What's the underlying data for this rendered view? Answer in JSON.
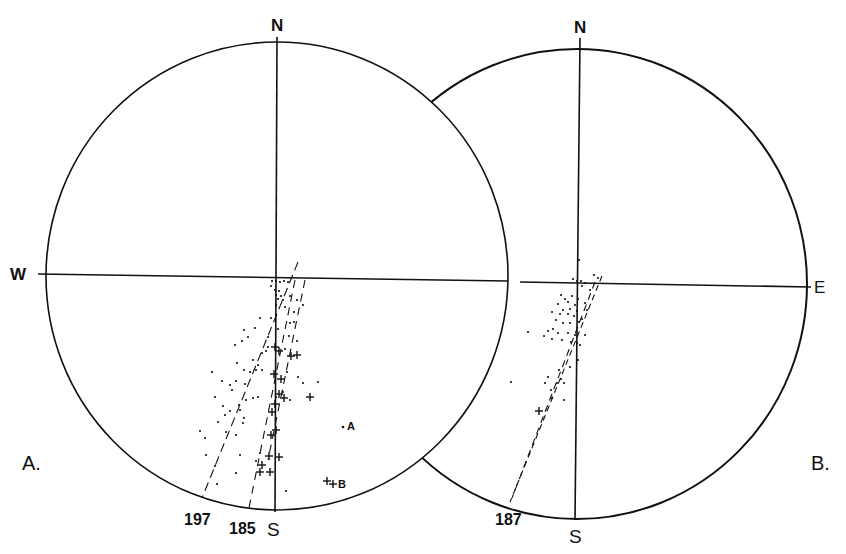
{
  "figure": {
    "panels": [
      {
        "id": "A",
        "panel_label": "A.",
        "directions": {
          "north": "N",
          "south": "S",
          "west": "W"
        },
        "trace_labels": [
          "197",
          "185"
        ],
        "point_labels": {
          "a": "A",
          "b": "B"
        },
        "center": [
          277,
          276
        ],
        "radius": [
          231,
          234
        ]
      },
      {
        "id": "B",
        "panel_label": "B.",
        "directions": {
          "north": "N",
          "south": "S",
          "east": "E"
        },
        "trace_labels": [
          "187"
        ],
        "center": [
          577,
          284
        ],
        "radius": [
          230,
          235
        ]
      }
    ],
    "colors": {
      "ink": "#111111",
      "background": "#ffffff"
    },
    "panelA_dots": [
      [
        272,
        281
      ],
      [
        276,
        281
      ],
      [
        280,
        282
      ],
      [
        284,
        281
      ],
      [
        288,
        282
      ],
      [
        271,
        286
      ],
      [
        275,
        290
      ],
      [
        279,
        291
      ],
      [
        276,
        295
      ],
      [
        281,
        296
      ],
      [
        278,
        299
      ],
      [
        290,
        296
      ],
      [
        283,
        300
      ],
      [
        297,
        300
      ],
      [
        276,
        305
      ],
      [
        285,
        307
      ],
      [
        294,
        312
      ],
      [
        303,
        305
      ],
      [
        276,
        315
      ],
      [
        290,
        323
      ],
      [
        294,
        322
      ],
      [
        271,
        318
      ],
      [
        260,
        318
      ],
      [
        278,
        329
      ],
      [
        268,
        337
      ],
      [
        289,
        336
      ],
      [
        297,
        341
      ],
      [
        255,
        328
      ],
      [
        244,
        330
      ],
      [
        248,
        337
      ],
      [
        285,
        349
      ],
      [
        268,
        347
      ],
      [
        262,
        353
      ],
      [
        253,
        360
      ],
      [
        258,
        365
      ],
      [
        266,
        351
      ],
      [
        242,
        341
      ],
      [
        235,
        345
      ],
      [
        237,
        363
      ],
      [
        244,
        370
      ],
      [
        250,
        372
      ],
      [
        256,
        370
      ],
      [
        262,
        370
      ],
      [
        236,
        381
      ],
      [
        245,
        384
      ],
      [
        212,
        372
      ],
      [
        222,
        381
      ],
      [
        230,
        385
      ],
      [
        232,
        390
      ],
      [
        287,
        372
      ],
      [
        298,
        377
      ],
      [
        303,
        383
      ],
      [
        318,
        382
      ],
      [
        276,
        397
      ],
      [
        283,
        392
      ],
      [
        290,
        400
      ],
      [
        246,
        400
      ],
      [
        239,
        405
      ],
      [
        253,
        398
      ],
      [
        258,
        397
      ],
      [
        215,
        397
      ],
      [
        223,
        406
      ],
      [
        230,
        411
      ],
      [
        240,
        410
      ],
      [
        200,
        431
      ],
      [
        205,
        438
      ],
      [
        218,
        422
      ],
      [
        243,
        423
      ],
      [
        226,
        432
      ],
      [
        236,
        435
      ],
      [
        240,
        455
      ],
      [
        260,
        453
      ],
      [
        256,
        461
      ],
      [
        206,
        455
      ],
      [
        215,
        466
      ],
      [
        236,
        473
      ],
      [
        217,
        484
      ],
      [
        286,
        491
      ],
      [
        225,
        415
      ],
      [
        244,
        418
      ]
    ],
    "panelA_crosses": [
      [
        275,
        347
      ],
      [
        279,
        351
      ],
      [
        291,
        356
      ],
      [
        297,
        355
      ],
      [
        274,
        374
      ],
      [
        281,
        379
      ],
      [
        279,
        394
      ],
      [
        284,
        398
      ],
      [
        310,
        397
      ],
      [
        275,
        404
      ],
      [
        272,
        412
      ],
      [
        276,
        430
      ],
      [
        271,
        435
      ],
      [
        269,
        456
      ],
      [
        279,
        457
      ],
      [
        262,
        465
      ],
      [
        260,
        472
      ],
      [
        270,
        472
      ],
      [
        327,
        481
      ]
    ],
    "panelA_point_A": [
      343,
      427
    ],
    "panelA_point_B": [
      333,
      484
    ],
    "panelB_dots": [
      [
        579,
        260
      ],
      [
        573,
        279
      ],
      [
        577,
        281
      ],
      [
        581,
        281
      ],
      [
        585,
        283
      ],
      [
        594,
        275
      ],
      [
        598,
        278
      ],
      [
        582,
        286
      ],
      [
        590,
        290
      ],
      [
        561,
        295
      ],
      [
        565,
        299
      ],
      [
        572,
        296
      ],
      [
        578,
        299
      ],
      [
        568,
        302
      ],
      [
        575,
        305
      ],
      [
        585,
        303
      ],
      [
        558,
        304
      ],
      [
        563,
        310
      ],
      [
        570,
        309
      ],
      [
        577,
        311
      ],
      [
        587,
        310
      ],
      [
        552,
        312
      ],
      [
        560,
        314
      ],
      [
        568,
        314
      ],
      [
        574,
        316
      ],
      [
        582,
        319
      ],
      [
        556,
        320
      ],
      [
        563,
        323
      ],
      [
        570,
        323
      ],
      [
        579,
        322
      ],
      [
        553,
        329
      ],
      [
        558,
        333
      ],
      [
        568,
        333
      ],
      [
        575,
        335
      ],
      [
        585,
        335
      ],
      [
        548,
        331
      ],
      [
        544,
        336
      ],
      [
        552,
        339
      ],
      [
        562,
        340
      ],
      [
        571,
        342
      ],
      [
        577,
        343
      ],
      [
        528,
        332
      ],
      [
        580,
        345
      ],
      [
        578,
        360
      ],
      [
        570,
        367
      ],
      [
        559,
        370
      ],
      [
        548,
        377
      ],
      [
        561,
        379
      ],
      [
        545,
        383
      ],
      [
        557,
        383
      ],
      [
        551,
        390
      ],
      [
        564,
        383
      ],
      [
        511,
        382
      ],
      [
        552,
        398
      ],
      [
        564,
        400
      ]
    ],
    "panelB_crosses": [
      [
        539,
        411
      ]
    ],
    "traces": [
      {
        "panel": "A",
        "label": "197",
        "x1": 298,
        "y1": 262,
        "x2": 202,
        "y2": 498,
        "dash": "9 5"
      },
      {
        "panel": "A",
        "label": "185",
        "x1": 295,
        "y1": 280,
        "x2": 249,
        "y2": 508,
        "dash": "8 6"
      },
      {
        "panel": "A",
        "label": "",
        "x1": 305,
        "y1": 280,
        "x2": 268,
        "y2": 460,
        "dash": "8 6"
      },
      {
        "panel": "B",
        "label": "187",
        "x1": 602,
        "y1": 276,
        "x2": 510,
        "y2": 502,
        "dash": "6 4"
      },
      {
        "panel": "B",
        "label": "",
        "x1": 595,
        "y1": 282,
        "x2": 512,
        "y2": 498,
        "dash": "7 5"
      }
    ]
  }
}
